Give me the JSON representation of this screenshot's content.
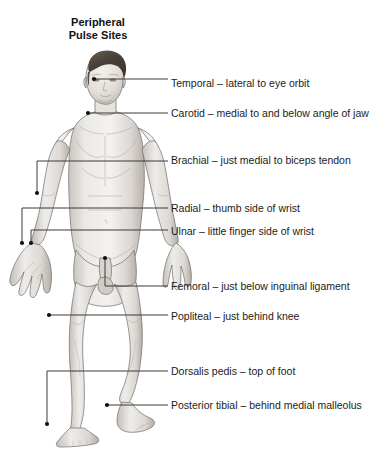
{
  "title": "Peripheral\nPulse Sites",
  "colors": {
    "background": "#ffffff",
    "text": "#1b1b1b",
    "leader_line": "#3a3a3a",
    "anchor_dot": "#111111",
    "skin_light": "#f2f0ee",
    "skin_mid": "#dedad6",
    "skin_shadow": "#b9b4b0",
    "outline": "#6f6b67",
    "hair_dark": "#4a4038",
    "hair_light": "#7d7066"
  },
  "figure": {
    "name": "anterior-male-anatomical-figure"
  },
  "pulse_sites": [
    {
      "id": "temporal",
      "label": "Temporal – lateral to eye orbit",
      "label_x": 171,
      "label_y": 78,
      "anchor": {
        "x": 94,
        "y": 79
      },
      "path": "M 94 79 L 168 79"
    },
    {
      "id": "carotid",
      "label": "Carotid – medial to and below angle of jaw",
      "label_x": 171,
      "label_y": 108,
      "anchor": {
        "x": 88,
        "y": 113
      },
      "path": "M 88 113 L 168 113"
    },
    {
      "id": "brachial",
      "label": "Brachial – just medial to biceps tendon",
      "label_x": 171,
      "label_y": 155,
      "anchor": {
        "x": 37,
        "y": 193
      },
      "path": "M 168 161 L 37 161 L 37 193"
    },
    {
      "id": "radial",
      "label": "Radial – thumb side of wrist",
      "label_x": 171,
      "label_y": 203,
      "anchor": {
        "x": 22,
        "y": 243
      },
      "path": "M 168 208 L 22 208 L 22 243"
    },
    {
      "id": "ulnar",
      "label": "Ulnar – little finger side of wrist",
      "label_x": 171,
      "label_y": 226,
      "anchor": {
        "x": 31,
        "y": 243
      },
      "path": "M 168 230 L 31 230 L 31 243"
    },
    {
      "id": "femoral",
      "label": "Femoral – just below inguinal ligament",
      "label_x": 171,
      "label_y": 281,
      "anchor": {
        "x": 105,
        "y": 258
      },
      "path": "M 105 258 L 105 286 L 168 286"
    },
    {
      "id": "popliteal",
      "label": "Popliteal – just behind knee",
      "label_x": 171,
      "label_y": 311,
      "anchor": {
        "x": 49,
        "y": 315
      },
      "path": "M 49 315 L 168 315"
    },
    {
      "id": "dorsalis-pedis",
      "label": "Dorsalis pedis – top of foot",
      "label_x": 171,
      "label_y": 366,
      "anchor": {
        "x": 47,
        "y": 424
      },
      "path": "M 168 371 L 47 371 L 47 424"
    },
    {
      "id": "posterior-tibial",
      "label": "Posterior tibial – behind medial malleolus",
      "label_x": 171,
      "label_y": 400,
      "anchor": {
        "x": 107,
        "y": 405
      },
      "path": "M 107 405 L 168 405"
    }
  ]
}
